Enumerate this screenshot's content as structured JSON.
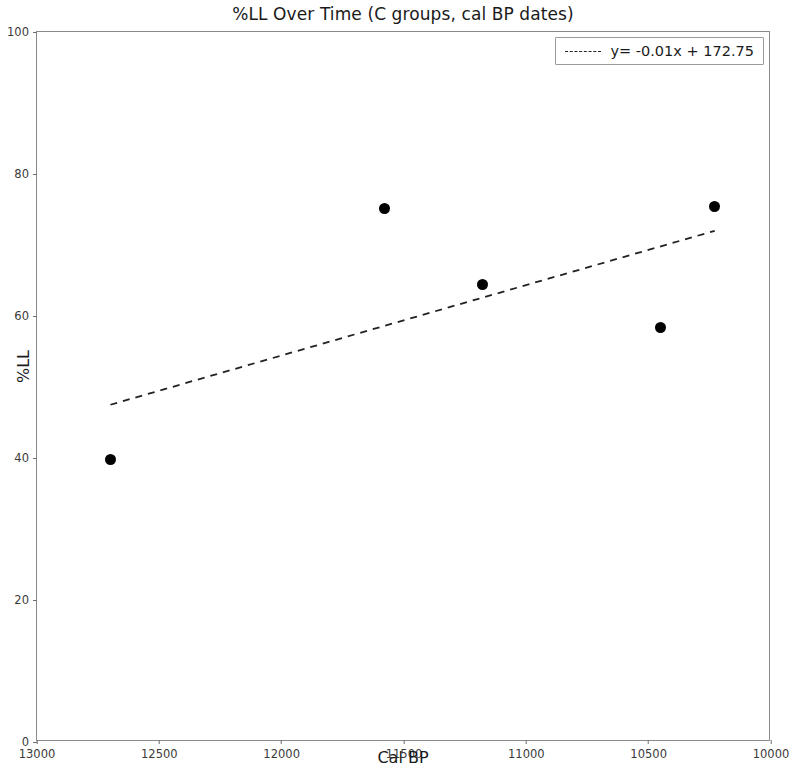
{
  "chart_data": {
    "type": "scatter",
    "title": "%LL Over Time (C groups, cal BP dates)",
    "xlabel": "Cal BP",
    "ylabel": "%LL",
    "xlim": [
      13000,
      10000
    ],
    "ylim": [
      0,
      100
    ],
    "x_inverted": true,
    "grid": false,
    "xticks": [
      13000,
      12500,
      12000,
      11500,
      11000,
      10500,
      10000
    ],
    "xticklabels": [
      "13000",
      "12500",
      "12000",
      "11500",
      "11000",
      "10500",
      "10000"
    ],
    "yticks": [
      0,
      20,
      40,
      60,
      80,
      100
    ],
    "yticklabels": [
      "0",
      "20",
      "40",
      "60",
      "80",
      "100"
    ],
    "marker_color": "#000000",
    "marker": "o",
    "points": [
      {
        "x": 12700,
        "y": 39.8
      },
      {
        "x": 11580,
        "y": 75.1
      },
      {
        "x": 11180,
        "y": 64.5
      },
      {
        "x": 10450,
        "y": 58.4
      },
      {
        "x": 10230,
        "y": 75.4
      }
    ],
    "trendline": {
      "label": "y= -0.01x + 172.75",
      "slope": -0.01,
      "intercept": 172.75,
      "style": "dashed",
      "color": "#222222",
      "x_start": 12700,
      "x_end": 10230,
      "y_start": 47.5,
      "y_end": 72.0
    },
    "legend": {
      "position": "upper right",
      "entries": [
        {
          "label": "y= -0.01x + 172.75",
          "style": "dashed",
          "color": "#222222"
        }
      ]
    }
  }
}
